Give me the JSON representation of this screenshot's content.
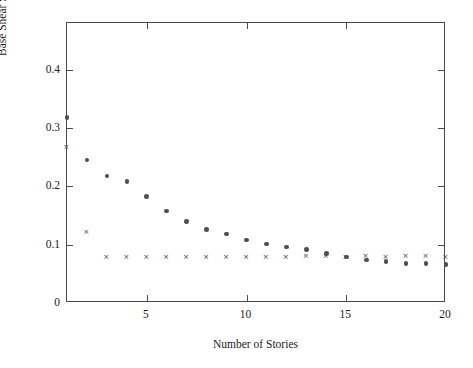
{
  "figure": {
    "background_color": "#ffffff",
    "axis_color": "#4a4a4a",
    "marker_color": "#4f4f4f"
  },
  "chart_data": {
    "type": "scatter",
    "title": "",
    "xlabel": "Number of Stories",
    "ylabel": "Base Shear Strength Coefficient",
    "xlim": [
      1,
      20
    ],
    "ylim": [
      0,
      0.48
    ],
    "grid": false,
    "legend": "none",
    "xticks": [
      5,
      10,
      15,
      20
    ],
    "xticklabels": [
      "5",
      "10",
      "15",
      "20"
    ],
    "yticks": [
      0,
      0.1,
      0.2,
      0.3,
      0.4
    ],
    "yticklabels": [
      "0",
      "0.1",
      "0.2",
      "0.3",
      "0.4"
    ],
    "x": [
      1,
      2,
      3,
      4,
      5,
      6,
      7,
      8,
      9,
      10,
      11,
      12,
      13,
      14,
      15,
      16,
      17,
      18,
      19,
      20
    ],
    "series": [
      {
        "name": "circle-series",
        "marker": "circle",
        "color": "#4f4f4f",
        "values": [
          0.318,
          0.245,
          0.218,
          0.208,
          0.183,
          0.158,
          0.14,
          0.126,
          0.118,
          0.108,
          0.101,
          0.096,
          0.092,
          0.085,
          0.079,
          0.074,
          0.071,
          0.068,
          0.068,
          0.066
        ]
      },
      {
        "name": "cross-series",
        "marker": "x",
        "color": "#4f4f4f",
        "values": [
          0.268,
          0.122,
          0.079,
          0.08,
          0.08,
          0.079,
          0.079,
          0.079,
          0.079,
          0.079,
          0.08,
          0.079,
          0.081,
          0.081,
          0.08,
          0.081,
          0.08,
          0.081,
          0.081,
          0.08
        ]
      }
    ]
  }
}
